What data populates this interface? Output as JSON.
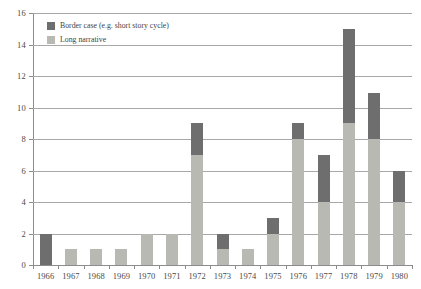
{
  "chart_data": {
    "type": "bar",
    "subtype": "stacked",
    "title": "",
    "xlabel": "",
    "ylabel": "",
    "ylim": [
      0,
      16
    ],
    "ytick_step": 2,
    "yticks": [
      0,
      2,
      4,
      6,
      8,
      10,
      12,
      14,
      16
    ],
    "grid": true,
    "legend_position": "top-left",
    "categories": [
      "1966",
      "1967",
      "1968",
      "1969",
      "1970",
      "1971",
      "1972",
      "1973",
      "1974",
      "1975",
      "1976",
      "1977",
      "1978",
      "1979",
      "1980"
    ],
    "series": [
      {
        "name": "Long narrative",
        "color": "#b9b9b4",
        "values": [
          0,
          1,
          1,
          1,
          2,
          2,
          7,
          1,
          1,
          2,
          8,
          4,
          9,
          8,
          4
        ]
      },
      {
        "name": "Border case (e.g. short story cycle)",
        "color": "#6e6e6e",
        "values": [
          2,
          0,
          0,
          0,
          0,
          0,
          2,
          1,
          0,
          1,
          1,
          3,
          6,
          2.9,
          2
        ]
      }
    ],
    "totals": [
      2,
      1,
      1,
      1,
      2,
      2,
      9,
      2,
      1,
      3,
      9,
      7,
      15,
      10.9,
      6
    ]
  },
  "legend": {
    "entries": [
      {
        "label": "Border case (e.g. short story cycle)",
        "color": "#6e6e6e"
      },
      {
        "label": "Long narrative",
        "color": "#b9b9b4"
      }
    ]
  },
  "colors": {
    "border_case": "#6e6e6e",
    "long_narrative": "#b9b9b4",
    "gridline": "#a8a8a8",
    "axis": "#8c8c8c",
    "text": "#4a4a4a",
    "background": "#ffffff"
  }
}
